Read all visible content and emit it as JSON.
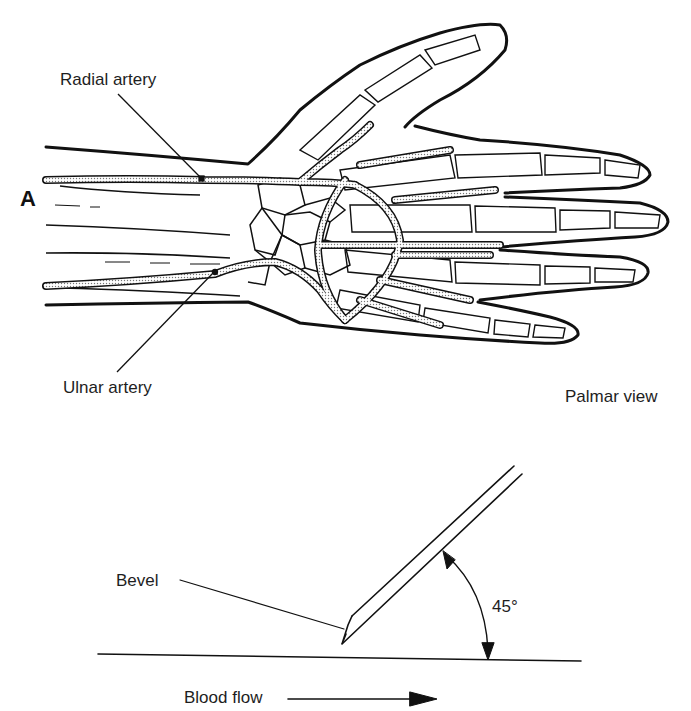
{
  "figure": {
    "panel_letter": "A",
    "hand_diagram": {
      "view_label": "Palmar view",
      "labels": {
        "radial_artery": "Radial artery",
        "ulnar_artery": "Ulnar artery"
      }
    },
    "needle_diagram": {
      "bevel_label": "Bevel",
      "angle_label": "45°",
      "flow_label": "Blood flow"
    }
  }
}
